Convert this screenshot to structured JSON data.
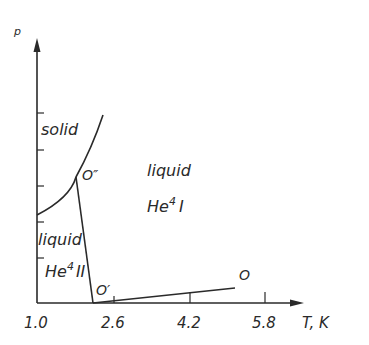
{
  "diagram": {
    "type": "phase-diagram",
    "y_axis": {
      "label": "p",
      "arrow": true
    },
    "x_axis": {
      "label": "T, K",
      "arrow": true,
      "ticks": [
        "1.0",
        "2.6",
        "4.2",
        "5.8"
      ]
    },
    "regions": {
      "solid": "solid",
      "liquid_he1_a": "liquid",
      "liquid_he1_b": "He",
      "liquid_he1_sup": "4",
      "liquid_he1_c": "I",
      "liquid_he2_a": "liquid",
      "liquid_he2_b": "He",
      "liquid_he2_sup": "4",
      "liquid_he2_c": "II"
    },
    "points": {
      "o_double_prime": "O″",
      "o_prime": "O′",
      "o": "O"
    },
    "colors": {
      "ink": "#2a2a2a",
      "background": "#ffffff"
    }
  }
}
